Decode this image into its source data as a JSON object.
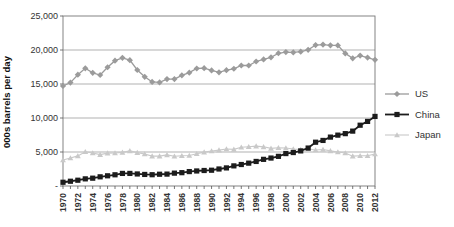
{
  "chart_data": {
    "type": "line",
    "title": "",
    "xlabel": "",
    "ylabel": "000s barrels per day",
    "ylim": [
      0,
      25000
    ],
    "grid": true,
    "legend_position": "right-outside",
    "xtick_every": 2,
    "yticks": [
      {
        "value": 0,
        "label": "-"
      },
      {
        "value": 5000,
        "label": "5,000"
      },
      {
        "value": 10000,
        "label": "10,000"
      },
      {
        "value": 15000,
        "label": "15,000"
      },
      {
        "value": 20000,
        "label": "20,000"
      },
      {
        "value": 25000,
        "label": "25,000"
      }
    ],
    "x": [
      1970,
      1971,
      1972,
      1973,
      1974,
      1975,
      1976,
      1977,
      1978,
      1979,
      1980,
      1981,
      1982,
      1983,
      1984,
      1985,
      1986,
      1987,
      1988,
      1989,
      1990,
      1991,
      1992,
      1993,
      1994,
      1995,
      1996,
      1997,
      1998,
      1999,
      2000,
      2001,
      2002,
      2003,
      2004,
      2005,
      2006,
      2007,
      2008,
      2009,
      2010,
      2011,
      2012
    ],
    "series": [
      {
        "name": "US",
        "color": "#9b9b9b",
        "marker": "diamond",
        "line_width": 1.3,
        "values": [
          14710,
          15210,
          16370,
          17310,
          16650,
          16320,
          17460,
          18430,
          18850,
          18510,
          17060,
          16060,
          15300,
          15230,
          15730,
          15730,
          16280,
          16670,
          17280,
          17330,
          16990,
          16710,
          17030,
          17240,
          17720,
          17720,
          18310,
          18620,
          18920,
          19520,
          19700,
          19650,
          19760,
          20030,
          20730,
          20800,
          20690,
          20680,
          19500,
          18770,
          19180,
          18880,
          18560
        ]
      },
      {
        "name": "China",
        "color": "#1c1c1c",
        "marker": "square",
        "line_width": 1.8,
        "values": [
          550,
          700,
          850,
          1050,
          1150,
          1350,
          1500,
          1650,
          1850,
          1850,
          1770,
          1700,
          1660,
          1730,
          1750,
          1890,
          1960,
          2120,
          2210,
          2280,
          2320,
          2500,
          2660,
          2960,
          3160,
          3360,
          3610,
          3920,
          4110,
          4360,
          4770,
          4920,
          5160,
          5580,
          6440,
          6700,
          7190,
          7480,
          7700,
          8070,
          8940,
          9500,
          10230
        ]
      },
      {
        "name": "Japan",
        "color": "#c9c9c9",
        "marker": "triangle",
        "line_width": 1.1,
        "values": [
          3820,
          4110,
          4430,
          5040,
          4860,
          4620,
          4840,
          4860,
          4950,
          5170,
          4910,
          4700,
          4390,
          4400,
          4580,
          4380,
          4440,
          4480,
          4750,
          4980,
          5140,
          5280,
          5450,
          5390,
          5700,
          5780,
          5870,
          5760,
          5530,
          5620,
          5580,
          5440,
          5350,
          5460,
          5290,
          5360,
          5170,
          5010,
          4850,
          4390,
          4440,
          4440,
          4700
        ]
      }
    ],
    "legend": [
      "US",
      "China",
      "Japan"
    ]
  }
}
